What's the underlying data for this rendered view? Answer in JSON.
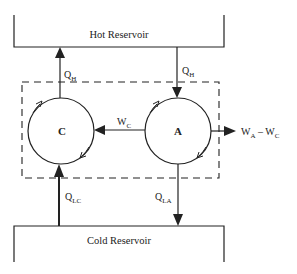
{
  "diagram": {
    "hot_reservoir": {
      "label": "Hot Reservoir"
    },
    "cold_reservoir": {
      "label": "Cold Reservoir"
    },
    "engine_c": {
      "label": "C"
    },
    "engine_a": {
      "label": "A"
    },
    "flows": {
      "qh_c": {
        "main": "Q",
        "sub": "H"
      },
      "qh_a": {
        "main": "Q",
        "sub": "H"
      },
      "wc": {
        "main": "W",
        "sub": "C"
      },
      "net_work": {
        "main1": "W",
        "sub1": "A",
        "sep": " – ",
        "main2": "W",
        "sub2": "C"
      },
      "qlc": {
        "main": "Q",
        "sub": "LC"
      },
      "qla": {
        "main": "Q",
        "sub": "LA"
      }
    },
    "colors": {
      "line": "#222222",
      "background": "#ffffff"
    }
  }
}
